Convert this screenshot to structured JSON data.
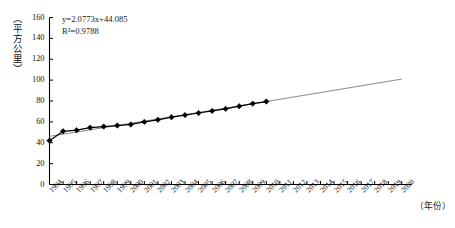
{
  "chart_data": {
    "type": "line",
    "title": "",
    "xlabel": "（年份）",
    "ylabel": "（平方公里）",
    "ylim": [
      0,
      160
    ],
    "ytick_step": 20,
    "yticks": [
      0,
      20,
      40,
      60,
      80,
      100,
      120,
      140,
      160
    ],
    "xlim": [
      1994,
      2020
    ],
    "grid": false,
    "legend": null,
    "annotations": {
      "equation": "y=2.0773x+44.085",
      "r_squared": "R²=0.9788"
    },
    "categories": [
      "1994",
      "1995",
      "1996",
      "1997",
      "1998",
      "1999",
      "2000",
      "2001",
      "2002",
      "2003",
      "2004",
      "2005",
      "2006",
      "2007",
      "2008",
      "2009",
      "2010",
      "2011",
      "2012",
      "2013",
      "2014",
      "2015",
      "2016",
      "2017",
      "2018",
      "2019",
      "2020"
    ],
    "series": [
      {
        "name": "observed",
        "marker": "diamond",
        "color": "#000000",
        "x": [
          1994,
          1995,
          1996,
          1997,
          1998,
          1999,
          2000,
          2001,
          2002,
          2003,
          2004,
          2005,
          2006,
          2007,
          2008,
          2009,
          2010
        ],
        "values": [
          42.0,
          51.0,
          52.0,
          54.5,
          55.5,
          56.5,
          57.5,
          60.0,
          62.0,
          64.5,
          66.5,
          68.5,
          70.5,
          72.5,
          75.0,
          77.5,
          79.5
        ]
      },
      {
        "name": "trend",
        "marker": "none",
        "color": "#8a8a8a",
        "x": [
          2010,
          2020
        ],
        "values": [
          79.5,
          101.0
        ]
      }
    ]
  },
  "axis": {
    "y_unit_label": "（平方公里）",
    "x_unit_label": "（年份）"
  }
}
